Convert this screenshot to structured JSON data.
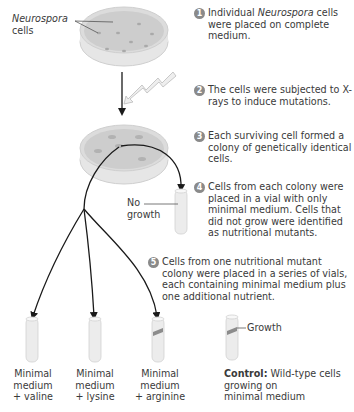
{
  "diagram": {
    "colors": {
      "step_circle": "#8a8a8a",
      "dish": "#d9d9d9",
      "dish_agar": "#c9c9c9",
      "arrow": "#1a1a1a",
      "tube": "#ececec",
      "growth": "#8c8c8c",
      "xray": "#e6e6e6"
    },
    "labels": {
      "neurospora_italic": "Neurospora",
      "neurospora_cells": "cells",
      "no_growth_1": "No",
      "no_growth_2": "growth",
      "growth": "Growth"
    },
    "steps": [
      {
        "number": "1",
        "pre": "Individual ",
        "italic": "Neurospora",
        "post": " cells were placed on complete medium."
      },
      {
        "number": "2",
        "text": "The cells were subjected to X-rays to induce mutations."
      },
      {
        "number": "3",
        "text": "Each surviving cell formed a colony of genetically identical cells."
      },
      {
        "number": "4",
        "text": "Cells from each colony were placed in a vial with only minimal medium. Cells that did not grow were identified as nutritional mutants."
      },
      {
        "number": "5",
        "text": "Cells from one nutritional mutant colony were placed in a series of vials, each containing minimal medium plus one additional nutrient."
      }
    ],
    "vials": [
      {
        "line1": "Minimal",
        "line2": "medium",
        "line3": "+ valine",
        "growth": false
      },
      {
        "line1": "Minimal",
        "line2": "medium",
        "line3": "+ lysine",
        "growth": false
      },
      {
        "line1": "Minimal",
        "line2": "medium",
        "line3": "+ arginine",
        "growth": true
      }
    ],
    "control": {
      "bold": "Control:",
      "text": " Wild-type cells",
      "line2": "growing on",
      "line3": "minimal medium"
    }
  }
}
